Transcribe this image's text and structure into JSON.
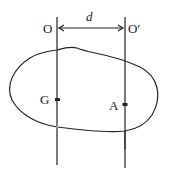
{
  "diagram": {
    "type": "parallel-axis-rigid-body",
    "labels": {
      "axis_left": "O",
      "axis_right": "O′",
      "distance": "d",
      "center_of_mass": "G",
      "point": "A"
    },
    "colors": {
      "stroke": "#222222",
      "background": "#ffffff"
    }
  }
}
